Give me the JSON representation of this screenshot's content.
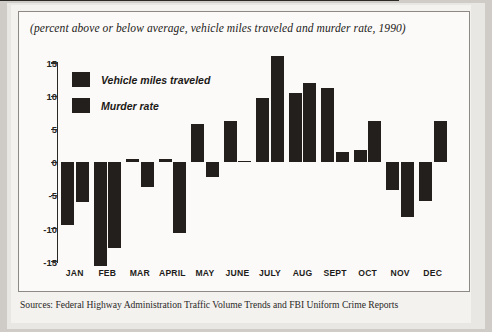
{
  "figure": {
    "subtitle": "(percent above or below average, vehicle miles traveled and murder rate, 1990)",
    "source": "Sources: Federal Highway Administration Traffic Volume Trends and FBI Uniform Crime Reports"
  },
  "colors": {
    "bar": "#231f1c",
    "axis": "#2b2926",
    "frame": "#8d8a85",
    "plot_background": "#fbfaf8",
    "page_background": "#cfccc7"
  },
  "chart_data": {
    "type": "bar",
    "title": "",
    "subtitle": "(percent above or below average, vehicle miles traveled and murder rate, 1990)",
    "xlabel": "",
    "ylabel": "",
    "ylim": [
      -17,
      17
    ],
    "yticks": [
      15,
      10,
      5,
      0,
      -5,
      -10,
      -15
    ],
    "ytick_labels": [
      "15",
      "10",
      "5",
      "0",
      "-5",
      "-10",
      "-15"
    ],
    "grid": false,
    "legend_position": "upper-left-inside",
    "categories": [
      "JAN",
      "FEB",
      "MAR",
      "APRIL",
      "MAY",
      "JUNE",
      "JULY",
      "AUG",
      "SEPT",
      "OCT",
      "NOV",
      "DEC"
    ],
    "series": [
      {
        "name": "Vehicle miles traveled",
        "color": "#231f1c",
        "values": [
          -9.5,
          -15.6,
          0.5,
          0.5,
          5.8,
          6.2,
          9.7,
          10.5,
          11.2,
          1.8,
          -4.2,
          -5.8
        ]
      },
      {
        "name": "Murder rate",
        "color": "#231f1c",
        "values": [
          -6.0,
          -13.0,
          -3.7,
          -10.7,
          -2.2,
          0.2,
          16.0,
          12.0,
          1.5,
          6.3,
          -8.3,
          6.3
        ]
      }
    ],
    "annotations": []
  }
}
